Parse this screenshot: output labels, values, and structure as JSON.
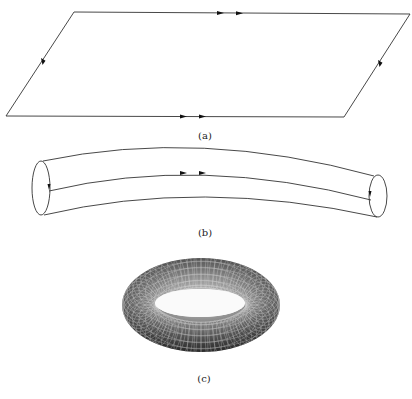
{
  "figure": {
    "panels": [
      {
        "id": "a",
        "label": "(a)",
        "description": "Parallelogram with identified opposite edges (double arrows on top/bottom, single arrows on left/right)"
      },
      {
        "id": "b",
        "label": "(b)",
        "description": "Bent cylinder formed by gluing one pair of edges, with double-arrow seam"
      },
      {
        "id": "c",
        "label": "(c)",
        "description": "Torus obtained by gluing the cylinder ends"
      }
    ],
    "colors": {
      "line": "#333333",
      "arrow": "#111111",
      "torus_dark": "#3a3a3a",
      "torus_light": "#bdbdbd",
      "background": "#ffffff"
    }
  }
}
